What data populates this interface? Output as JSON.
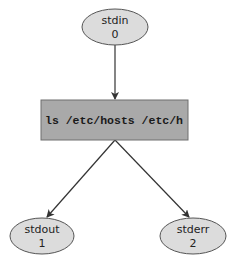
{
  "diagram": {
    "title": "",
    "colors": {
      "ellipse_fill": "#dcdcdc",
      "ellipse_stroke": "#555555",
      "box_fill": "#a9a9a9",
      "box_stroke": "#6e6e6e",
      "edge": "#333333"
    },
    "nodes": {
      "stdin": {
        "name": "stdin",
        "fd": "0"
      },
      "command": {
        "text": "ls /etc/hosts /etc/h"
      },
      "stdout": {
        "name": "stdout",
        "fd": "1"
      },
      "stderr": {
        "name": "stderr",
        "fd": "2"
      }
    },
    "edges": [
      {
        "from": "stdin",
        "to": "command"
      },
      {
        "from": "command",
        "to": "stdout"
      },
      {
        "from": "command",
        "to": "stderr"
      }
    ]
  }
}
